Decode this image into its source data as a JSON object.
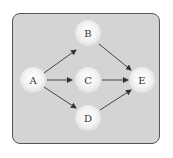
{
  "diagram": {
    "type": "directed-graph",
    "nodes": [
      {
        "id": "A",
        "label": "A",
        "x": 33,
        "y": 80
      },
      {
        "id": "B",
        "label": "B",
        "x": 88,
        "y": 33
      },
      {
        "id": "C",
        "label": "C",
        "x": 88,
        "y": 80
      },
      {
        "id": "D",
        "label": "D",
        "x": 88,
        "y": 118
      },
      {
        "id": "E",
        "label": "E",
        "x": 142,
        "y": 80
      }
    ],
    "edges": [
      {
        "from": "A",
        "to": "B"
      },
      {
        "from": "A",
        "to": "C"
      },
      {
        "from": "A",
        "to": "D"
      },
      {
        "from": "B",
        "to": "E"
      },
      {
        "from": "C",
        "to": "E"
      },
      {
        "from": "D",
        "to": "E"
      }
    ],
    "colors": {
      "background": "#d4d4d4",
      "border": "#555555",
      "edge": "#333333",
      "node": "#f4f4f4"
    }
  }
}
